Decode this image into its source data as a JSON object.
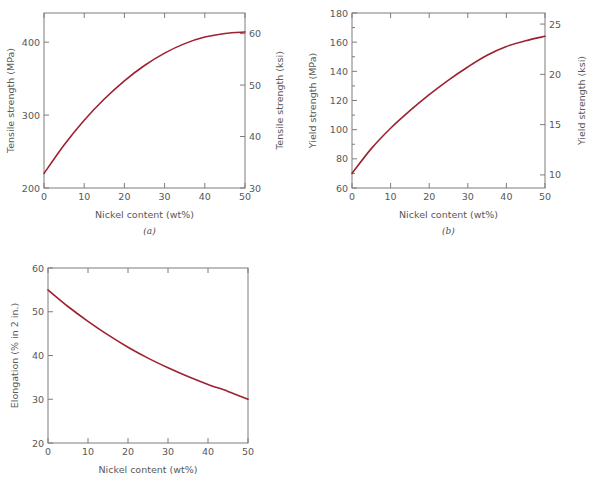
{
  "figure": {
    "panels": [
      {
        "id": "a",
        "caption": "(a)",
        "xlabel": "Nickel content (wt%)",
        "ylabel_left": "Tensile strength (MPa)",
        "ylabel_right": "Tensile strength (ksi)",
        "x_ticks": [
          "0",
          "10",
          "20",
          "30",
          "40",
          "50"
        ],
        "y_ticks_left": [
          "200",
          "300",
          "400"
        ],
        "y_ticks_right": [
          "30",
          "40",
          "50",
          "60"
        ]
      },
      {
        "id": "b",
        "caption": "(b)",
        "xlabel": "Nickel content (wt%)",
        "ylabel_left": "Yield strength (MPa)",
        "ylabel_right": "Yield strength (ksi)",
        "x_ticks": [
          "0",
          "10",
          "20",
          "30",
          "40",
          "50"
        ],
        "y_ticks_left": [
          "60",
          "80",
          "100",
          "120",
          "140",
          "160",
          "180"
        ],
        "y_ticks_right": [
          "10",
          "15",
          "20",
          "25"
        ]
      },
      {
        "id": "c",
        "caption": "",
        "xlabel": "Nickel content (wt%)",
        "ylabel_left": "Elongation (% in 2 in.)",
        "ylabel_right": "",
        "x_ticks": [
          "0",
          "10",
          "20",
          "30",
          "40",
          "50"
        ],
        "y_ticks_left": [
          "20",
          "30",
          "40",
          "50",
          "60"
        ],
        "y_ticks_right": []
      }
    ],
    "colors": {
      "curve": "#a02030",
      "axis": "#7d7d7d",
      "text": "#585858"
    }
  },
  "chart_data": [
    {
      "type": "line",
      "panel": "a",
      "title": "",
      "xlabel": "Nickel content (wt%)",
      "ylabel": "Tensile strength (MPa)",
      "ylabel_secondary": "Tensile strength (ksi)",
      "xlim": [
        0,
        50
      ],
      "ylim": [
        200,
        440
      ],
      "ylim_secondary": [
        30,
        64
      ],
      "xticks": [
        0,
        10,
        20,
        30,
        40,
        50
      ],
      "yticks": [
        200,
        300,
        400
      ],
      "yticks_secondary": [
        30,
        40,
        50,
        60
      ],
      "grid": false,
      "legend": "none",
      "series": [
        {
          "name": "Tensile strength",
          "x": [
            0,
            5,
            10,
            15,
            20,
            25,
            30,
            35,
            40,
            45,
            50
          ],
          "values": [
            220,
            259,
            293,
            322,
            347,
            368,
            385,
            398,
            407,
            412,
            414
          ]
        }
      ]
    },
    {
      "type": "line",
      "panel": "b",
      "title": "",
      "xlabel": "Nickel content (wt%)",
      "ylabel": "Yield strength (MPa)",
      "ylabel_secondary": "Yield strength (ksi)",
      "xlim": [
        0,
        50
      ],
      "ylim": [
        60,
        180
      ],
      "ylim_secondary": [
        8.7,
        26.1
      ],
      "xticks": [
        0,
        10,
        20,
        30,
        40,
        50
      ],
      "yticks": [
        60,
        80,
        100,
        120,
        140,
        160,
        180
      ],
      "yticks_secondary": [
        10,
        15,
        20,
        25
      ],
      "grid": false,
      "legend": "none",
      "series": [
        {
          "name": "Yield strength",
          "x": [
            0,
            5,
            10,
            15,
            20,
            25,
            30,
            35,
            40,
            45,
            50
          ],
          "values": [
            70,
            87,
            101,
            113,
            124,
            134,
            143,
            151,
            157,
            161,
            164
          ]
        }
      ]
    },
    {
      "type": "line",
      "panel": "c",
      "title": "",
      "xlabel": "Nickel content (wt%)",
      "ylabel": "Elongation (% in 2 in.)",
      "ylabel_secondary": "",
      "xlim": [
        0,
        50
      ],
      "ylim": [
        20,
        60
      ],
      "xticks": [
        0,
        10,
        20,
        30,
        40,
        50
      ],
      "yticks": [
        20,
        30,
        40,
        50,
        60
      ],
      "grid": false,
      "legend": "none",
      "series": [
        {
          "name": "Elongation",
          "x": [
            0,
            5,
            10,
            15,
            20,
            25,
            30,
            35,
            40,
            45,
            50
          ],
          "values": [
            55,
            51.2,
            47.8,
            44.7,
            41.9,
            39.4,
            37.2,
            35.2,
            33.4,
            31.8,
            30
          ]
        }
      ]
    }
  ]
}
